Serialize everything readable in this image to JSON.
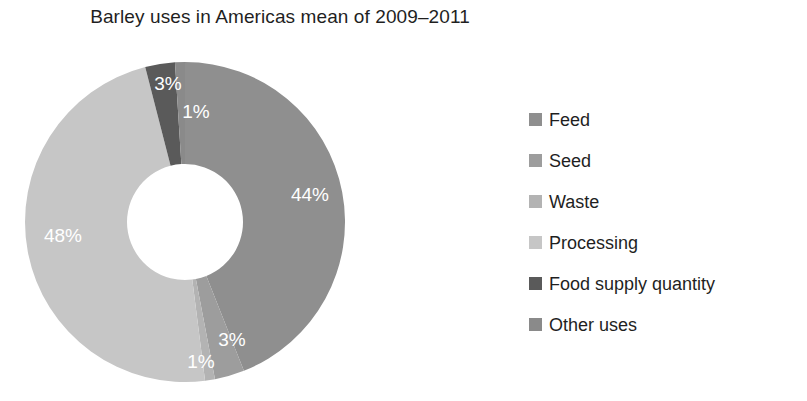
{
  "chart_data": {
    "type": "pie",
    "title": "Barley uses in Americas mean of 2009–2011",
    "subtitle": "",
    "xlabel": "",
    "ylabel": "",
    "donut": true,
    "legend_position": "right",
    "grid": false,
    "start_angle_deg": 0,
    "direction": "clockwise",
    "value_unit": "%",
    "categories": [
      "Feed",
      "Seed",
      "Waste",
      "Processing",
      "Food supply quantity",
      "Other uses"
    ],
    "values": [
      44,
      3,
      1,
      48,
      3,
      1
    ],
    "labels": [
      "44%",
      "3%",
      "1%",
      "48%",
      "3%",
      "1%"
    ],
    "colors": [
      "#8f8f8f",
      "#9d9d9d",
      "#b3b3b3",
      "#c6c6c6",
      "#5a5a5a",
      "#8a8a8a"
    ],
    "slices": [
      {
        "name": "Feed",
        "value": 44,
        "label": "44%",
        "color": "#8f8f8f",
        "label_x": 310,
        "label_y": 196
      },
      {
        "name": "Seed",
        "value": 3,
        "label": "3%",
        "color": "#9d9d9d",
        "label_x": 232,
        "label_y": 341
      },
      {
        "name": "Waste",
        "value": 1,
        "label": "1%",
        "color": "#b3b3b3",
        "label_x": 201,
        "label_y": 363
      },
      {
        "name": "Processing",
        "value": 48,
        "label": "48%",
        "color": "#c6c6c6",
        "label_x": 63,
        "label_y": 237
      },
      {
        "name": "Food supply quantity",
        "value": 3,
        "label": "3%",
        "color": "#5a5a5a",
        "label_x": 168,
        "label_y": 85
      },
      {
        "name": "Other uses",
        "value": 1,
        "label": "1%",
        "color": "#8a8a8a",
        "label_x": 196,
        "label_y": 113
      }
    ]
  },
  "title": {
    "text": "Barley uses in Americas mean of 2009–2011"
  },
  "legend": {
    "items": [
      {
        "label": "Feed",
        "color": "#8f8f8f"
      },
      {
        "label": "Seed",
        "color": "#9d9d9d"
      },
      {
        "label": "Waste",
        "color": "#b3b3b3"
      },
      {
        "label": "Processing",
        "color": "#c6c6c6"
      },
      {
        "label": "Food supply quantity",
        "color": "#5a5a5a"
      },
      {
        "label": "Other uses",
        "color": "#8a8a8a"
      }
    ]
  }
}
